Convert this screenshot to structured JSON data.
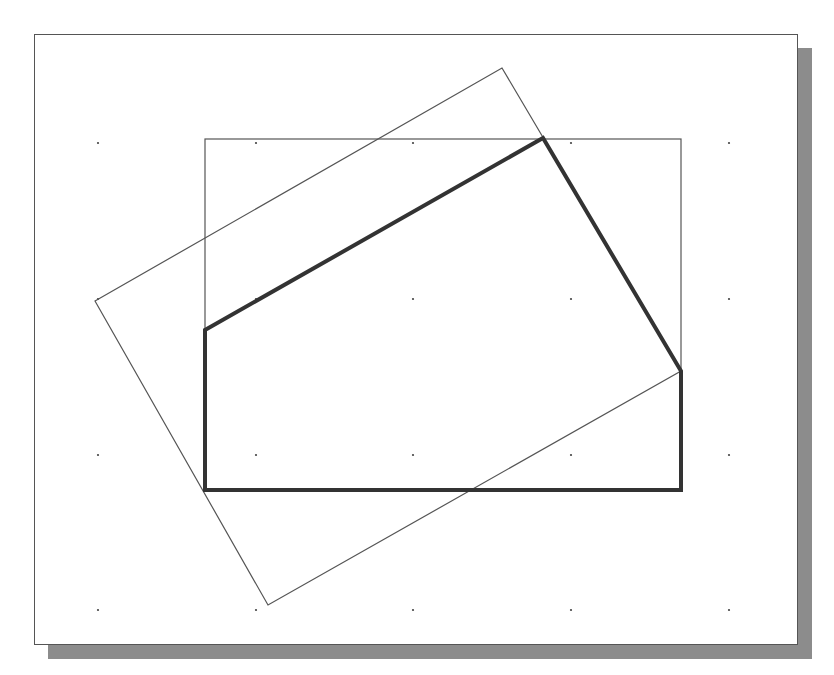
{
  "figure": {
    "type": "cad-sketch-viewport",
    "colors": {
      "background": "#ffffff",
      "frame_border": "#555555",
      "shadow": "#8c8c8c",
      "thin_lines": "#555555",
      "thick_profile": "#333333",
      "grid_dots": "#444444"
    },
    "viewport_frame": {
      "x": 34,
      "y": 34,
      "width": 764,
      "height": 611
    },
    "drop_shadow": {
      "offset_x": 15,
      "offset_y": 14
    },
    "grid": {
      "x": [
        98,
        256,
        413,
        571,
        729
      ],
      "y": [
        143,
        299,
        455,
        610
      ]
    },
    "reference_rectangle": {
      "x1": 205,
      "y1": 139,
      "x2": 681,
      "y2": 490
    },
    "rotated_rectangle": {
      "points": [
        [
          95,
          301
        ],
        [
          502,
          68
        ],
        [
          681,
          371
        ],
        [
          268,
          605
        ]
      ]
    },
    "profile_polyline": {
      "points": [
        [
          205,
          330
        ],
        [
          543,
          138
        ],
        [
          681,
          371
        ],
        [
          681,
          490
        ],
        [
          205,
          490
        ]
      ],
      "closed": true
    }
  }
}
